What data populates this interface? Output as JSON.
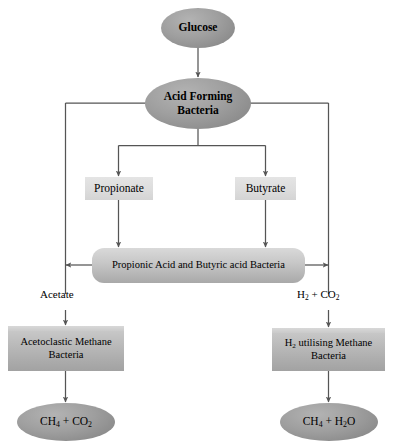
{
  "diagram": {
    "colors": {
      "ellipse_fill": "#9f9f9f",
      "box_light_fill": "#dddddd",
      "box_medium_fill": "#b4b4b4",
      "bar_fill": "#c8c8c8",
      "edge_stroke": "#555555",
      "text": "#000000",
      "background": "#ffffff"
    },
    "nodes": {
      "glucose": {
        "label": "Glucose",
        "shape": "ellipse"
      },
      "acid_forming_bacteria": {
        "line1": "Acid Forming",
        "line2": "Bacteria",
        "shape": "ellipse"
      },
      "propionate": {
        "label": "Propionate",
        "shape": "rectangle"
      },
      "butyrate": {
        "label": "Butyrate",
        "shape": "rectangle"
      },
      "propionic_butyric_bacteria": {
        "label": "Propionic Acid and Butyric acid Bacteria",
        "shape": "rounded-rectangle"
      },
      "acetoclastic_methane_bacteria": {
        "line1": "Acetoclastic  Methane",
        "line2": "Bacteria",
        "shape": "rectangle"
      },
      "h2_utilising_methane_bacteria": {
        "line1_pre": "H",
        "line1_sub": "2",
        "line1_post": " utilising Methane",
        "line2": "Bacteria",
        "shape": "rectangle"
      },
      "methane_co2_product": {
        "part1_pre": "CH",
        "part1_sub": "4",
        "plus": " + ",
        "part2_pre": "CO",
        "part2_sub": "2",
        "shape": "ellipse"
      },
      "methane_water_product": {
        "part1_pre": "CH",
        "part1_sub": "4",
        "plus": " + ",
        "part2_pre": "H",
        "part2_sub": "2",
        "part2_post": "O",
        "shape": "ellipse"
      }
    },
    "edge_labels": {
      "acetate": "Acetate",
      "hydrogen_carbon_dioxide": {
        "pre": "H",
        "sub1": "2",
        "plus": " + ",
        "post": "CO",
        "sub2": "2"
      }
    }
  }
}
